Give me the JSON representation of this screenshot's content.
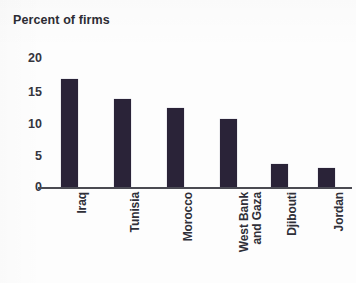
{
  "chart_data": {
    "type": "bar",
    "title": "Percent of firms",
    "subtitle": "",
    "xlabel": "",
    "ylabel": "",
    "categories": [
      "Iraq",
      "Tunisia",
      "Morocco",
      "West Bank\nand Gaza",
      "Djibouti",
      "Jordan"
    ],
    "values": [
      16.9,
      13.8,
      12.3,
      10.6,
      3.6,
      3.0
    ],
    "ylim": [
      0,
      20
    ],
    "ytick_labels": [
      "20",
      "15",
      "10",
      "5",
      "0"
    ],
    "ytick_values": [
      20,
      15,
      10,
      5,
      0
    ],
    "grid": false,
    "legend": false,
    "bar_color": "#2a2338",
    "axis_color": "#4a4a52",
    "text_color": "#2f2f38"
  },
  "figure": {
    "title": "Percent of firms",
    "y_ticks": [
      {
        "label": "20",
        "value": 20
      },
      {
        "label": "15",
        "value": 15
      },
      {
        "label": "10",
        "value": 10
      },
      {
        "label": "5",
        "value": 5
      },
      {
        "label": "0",
        "value": 0
      }
    ],
    "bars": [
      {
        "category": "Iraq",
        "value": 16.9
      },
      {
        "category": "Tunisia",
        "value": 13.8
      },
      {
        "category": "Morocco",
        "value": 12.3
      },
      {
        "category": "West Bank\nand Gaza",
        "value": 10.6
      },
      {
        "category": "Djibouti",
        "value": 3.6
      },
      {
        "category": "Jordan",
        "value": 3.0
      }
    ]
  }
}
